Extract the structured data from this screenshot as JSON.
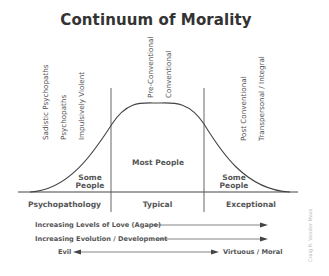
{
  "title": "Continuum of Morality",
  "vertical_labels": {
    "left": [
      "Sadistic Psychopaths",
      "Psychopaths",
      "Impulsively Violent"
    ],
    "center": [
      "Pre-Conventional",
      "Conventional"
    ],
    "right": [
      "Post Conventional",
      "Transpersonal / Integral"
    ]
  },
  "regions": {
    "left_population": "Some People",
    "center_population": "Most People",
    "right_population": "Some People"
  },
  "categories": [
    "Psychopathology",
    "Typical",
    "Exceptional"
  ],
  "arrows": [
    {
      "label": "Increasing Levels of Love (Agape)",
      "direction": "right"
    },
    {
      "label": "Increasing Evolution / Development",
      "direction": "right"
    },
    {
      "left_label": "Evil",
      "right_label": "Virtuous / Moral",
      "direction": "both"
    }
  ],
  "credit": "Craig R. Vander Maas",
  "colors": {
    "line": "#444444",
    "text": "#555555",
    "title": "#333333"
  }
}
